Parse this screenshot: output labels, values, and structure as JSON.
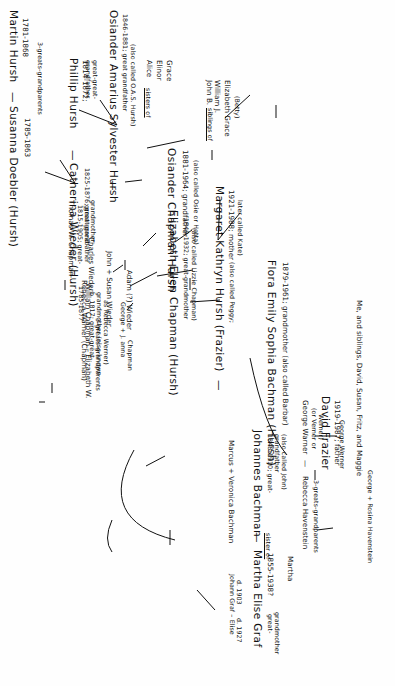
{
  "document": {
    "type": "handwritten family tree",
    "orientation": "rotated 90 degrees clockwise",
    "ink_color": "#111111",
    "paper_color": "#fefefe"
  },
  "people": {
    "martin_hursh": {
      "name": "Martin Hursh",
      "dates": "1781-1868",
      "note": "3-greats-grandparents"
    },
    "susanna_doebler": {
      "name": "Susanna Doebler (Hursh)",
      "dates": "1785-1863"
    },
    "phillip_hursh": {
      "name": "Phillip Hursh",
      "dates": "1814-1872;",
      "note": "great-great-grandfather"
    },
    "catherina_wieder": {
      "name": "Catherina Wieder (Hursh)",
      "dates": "1825-1876; great-great-",
      "note": "grandmother"
    },
    "adam_wieder": {
      "name": "Adam (?) Wieder"
    },
    "john_susan_wieder": {
      "name": "John + Susan Wieder"
    },
    "charles_wieder": {
      "name": "Charles Wieder"
    },
    "george_janet_chapman": {
      "name": "George + J. anna",
      "surname": "Chapman"
    },
    "william_chapman": {
      "name": "William Chapman – Elizabeth W.",
      "dates": "1785-1877",
      "note": "3-greats-grandparents"
    },
    "thomas_chapman": {
      "name": "Thomas W. Chapman",
      "dates": "1815-1905; great-",
      "note": "great grandfather"
    },
    "rebecca_warner": {
      "name": "Rebecca Warner (Chapman)",
      "dates": "b. 1817; great-great-",
      "note": "grandmother (also known",
      "note2": "as Rebecca Werner)"
    },
    "george_werner_sr": {
      "name": "George Werner"
    },
    "george_warner": {
      "name": "George Warner",
      "alt": "(or Verner or",
      "alt2": "Werner)"
    },
    "rebecca_havenstein": {
      "name": "Rebecca Havenstein",
      "note": "3-greats-grandparents"
    },
    "george_rosina_havenstein": {
      "name": "George + Rosina Havenstein"
    },
    "osiander_amarius": {
      "name": "Osiander Amarius Sylvester Hursh",
      "dates": "1846-1881; great grandfather",
      "note": "(also called O.A.S. Hursh)"
    },
    "elizabeth_ellen_chapman": {
      "name": "Elizabeth Ellen Chapman (Hursh)",
      "dates": "1849-1932; great-grandmother",
      "note": "(also called Lizzie Chapman)"
    },
    "alice_elinor_grace": {
      "names": [
        "Alice",
        "Elinor",
        "Grace"
      ],
      "relation": "sisters of"
    },
    "osiander_chapman": {
      "name": "Osiander Chapman Hursh",
      "dates": "1881-1964; grandfather",
      "note": "(also called Osie or Hatta)"
    },
    "siblings_of_margaret": {
      "names": [
        "John B.",
        "William J.",
        "Elizabeth Grace",
        "(Betty)"
      ],
      "relation": "siblings of"
    },
    "margaret_kathryn": {
      "name": "Margaret Kathryn Hursh (Frazier)",
      "dates": "1921-1988; mother",
      "note": "(also called Peggy;",
      "note2": "later called Kate)"
    },
    "flora_emily": {
      "name": "Flora Emily Sophia Bachman (Hursh)",
      "dates": "1879-1961; grandmother (also called Barbar)"
    },
    "marcus_veronica": {
      "name": "Marcus + Veronica Bachman"
    },
    "johannes_bachman": {
      "name": "Johannes Bachman",
      "dates": "1848-1910; great-",
      "note": "grandfather",
      "note2": "(also called John)"
    },
    "martha_elise_graf": {
      "name": "Martha Elise Graf",
      "dates": "1855-1938?",
      "note": "great-",
      "note2": "grandmother"
    },
    "johann_graf": {
      "name": "Johann Graf – Elise",
      "dates": "d. 1903",
      "dates2": "d. 1927"
    },
    "martha_sibling": {
      "relation": "sister of",
      "name": "Martha"
    },
    "david_frazier": {
      "name": "David Frazier",
      "dates": "1919-1987; father"
    },
    "me_and_siblings": {
      "text": "Me, and siblings, David, Susan, Fritz, and Maggie"
    }
  },
  "connectors": {
    "dash": "—"
  }
}
